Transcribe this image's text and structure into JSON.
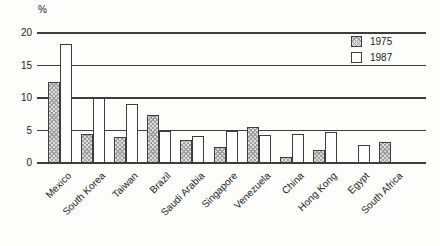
{
  "figure": {
    "unit_label": "%"
  },
  "colors": {
    "background": "#fdfdfc",
    "line": "#3d3d3d",
    "text": "#222222",
    "hatch_fill": "#e0e0e0",
    "hatch_pattern": "#9e9e9e",
    "white_bar": "#ffffff"
  },
  "chart_data": {
    "type": "bar",
    "title": "",
    "xlabel": "",
    "ylabel": "%",
    "ylim": [
      0,
      20
    ],
    "y_ticks": [
      0,
      5,
      10,
      15,
      20
    ],
    "grid": true,
    "legend_position": "top-right",
    "categories": [
      "Mexico",
      "South Korea",
      "Taiwan",
      "Brazil",
      "Saudi Arabia",
      "Singapore",
      "Venezuela",
      "China",
      "Hong Kong",
      "Egypt",
      "South Africa"
    ],
    "series": [
      {
        "name": "1975",
        "style": "hatched",
        "values": [
          12.4,
          4.5,
          4.0,
          7.4,
          3.5,
          2.5,
          5.6,
          1.0,
          2.0,
          null,
          3.2
        ]
      },
      {
        "name": "1987",
        "style": "white",
        "values": [
          18.3,
          10.0,
          9.1,
          5.0,
          4.2,
          5.0,
          4.3,
          4.4,
          4.7,
          2.7,
          null
        ]
      }
    ]
  }
}
